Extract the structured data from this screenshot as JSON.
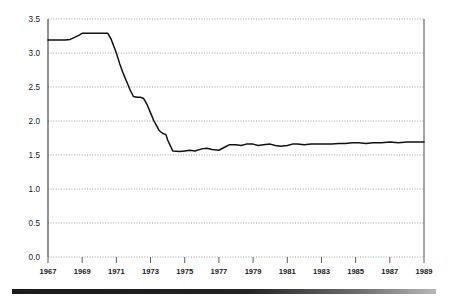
{
  "chart_data": {
    "type": "line",
    "title": "",
    "subtitle": "",
    "xlabel": "",
    "ylabel": "",
    "xlim": [
      1967,
      1989
    ],
    "ylim": [
      0.0,
      3.5
    ],
    "grid": true,
    "legend": false,
    "y_ticks": [
      "3.5",
      "3.0",
      "2.5",
      "2.0",
      "1.5",
      "1.0",
      "0.5",
      "0.0"
    ],
    "y_tick_values": [
      3.5,
      3.0,
      2.5,
      2.0,
      1.5,
      1.0,
      0.5,
      0.0
    ],
    "x_ticks": [
      "1967",
      "1969",
      "1971",
      "1973",
      "1975",
      "1977",
      "1979",
      "1981",
      "1983",
      "1985",
      "1987",
      "1989"
    ],
    "x_tick_values": [
      1967,
      1969,
      1971,
      1973,
      1975,
      1977,
      1979,
      1981,
      1983,
      1985,
      1987,
      1989
    ],
    "series": [
      {
        "name": "value",
        "color": "#111111",
        "x": [
          1967.0,
          1967.5,
          1968.0,
          1968.3,
          1968.8,
          1969.0,
          1969.3,
          1969.8,
          1970.2,
          1970.5,
          1970.7,
          1971.0,
          1971.2,
          1971.4,
          1971.6,
          1971.8,
          1972.0,
          1972.2,
          1972.4,
          1972.6,
          1972.8,
          1973.0,
          1973.2,
          1973.4,
          1973.5,
          1973.7,
          1973.9,
          1974.0,
          1974.3,
          1974.7,
          1975.0,
          1975.3,
          1975.6,
          1976.0,
          1976.3,
          1976.6,
          1977.0,
          1977.3,
          1977.6,
          1978.0,
          1978.3,
          1978.6,
          1979.0,
          1979.3,
          1979.6,
          1980.0,
          1980.3,
          1980.6,
          1981.0,
          1981.3,
          1981.6,
          1982.0,
          1982.4,
          1982.8,
          1983.2,
          1983.6,
          1984.0,
          1984.4,
          1984.8,
          1985.2,
          1985.6,
          1986.0,
          1986.5,
          1987.0,
          1987.5,
          1988.0,
          1988.5,
          1989.0
        ],
        "y": [
          3.19,
          3.19,
          3.19,
          3.2,
          3.26,
          3.29,
          3.29,
          3.29,
          3.29,
          3.29,
          3.2,
          3.0,
          2.84,
          2.7,
          2.58,
          2.46,
          2.36,
          2.35,
          2.35,
          2.33,
          2.24,
          2.12,
          2.0,
          1.91,
          1.86,
          1.82,
          1.8,
          1.72,
          1.56,
          1.55,
          1.56,
          1.57,
          1.56,
          1.59,
          1.6,
          1.58,
          1.57,
          1.61,
          1.65,
          1.65,
          1.64,
          1.66,
          1.66,
          1.64,
          1.65,
          1.66,
          1.64,
          1.63,
          1.64,
          1.66,
          1.66,
          1.65,
          1.66,
          1.66,
          1.66,
          1.66,
          1.67,
          1.67,
          1.68,
          1.68,
          1.67,
          1.68,
          1.68,
          1.69,
          1.68,
          1.69,
          1.69,
          1.69
        ]
      }
    ]
  },
  "footer": {
    "bar_color": "#1b1b1b"
  }
}
